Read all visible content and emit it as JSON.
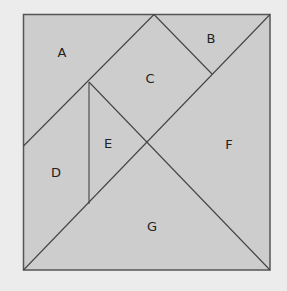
{
  "diagram": {
    "type": "tangram-square",
    "background": "#ececec",
    "fill": "#cdcdcd",
    "stroke": "#555555",
    "pieces": [
      {
        "label": "A",
        "x": 62,
        "y": 52
      },
      {
        "label": "B",
        "x": 211,
        "y": 38
      },
      {
        "label": "C",
        "x": 150,
        "y": 78
      },
      {
        "label": "D",
        "x": 56,
        "y": 172
      },
      {
        "label": "E",
        "x": 108,
        "y": 143
      },
      {
        "label": "F",
        "x": 229,
        "y": 144
      },
      {
        "label": "G",
        "x": 152,
        "y": 226
      }
    ]
  }
}
